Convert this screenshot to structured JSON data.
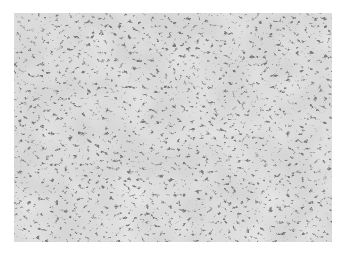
{
  "image": {
    "description": "Grayscale optical micrograph of a metallic microstructure showing a dense network of dark dendritic/acicular phase particles dispersed in a light gray matrix",
    "colors": {
      "background": "#ffffff",
      "matrix": "#dcdcdc",
      "dark_phase": "#555555"
    },
    "has_text": false,
    "has_scale_bar": false
  }
}
